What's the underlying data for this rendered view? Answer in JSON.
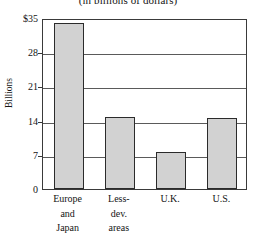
{
  "chart_data": {
    "type": "bar",
    "title": "(in billions of dollars)",
    "xlabel": "",
    "ylabel": "Billions",
    "categories": [
      "Europe and Japan",
      "Less-dev. areas",
      "U.K.",
      "U.S."
    ],
    "category_lines": [
      [
        "Europe",
        "and",
        "Japan"
      ],
      [
        "Less-",
        "dev.",
        "areas"
      ],
      [
        "U.K."
      ],
      [
        "U.S."
      ]
    ],
    "values": [
      34,
      14.7,
      7.5,
      14.5
    ],
    "ylim": [
      0,
      35
    ],
    "yticks": [
      0,
      7,
      14,
      21,
      28,
      35
    ],
    "ytick_labels": [
      "0",
      "7",
      "14",
      "21",
      "28",
      "$35"
    ],
    "grid": true,
    "legend": "none",
    "bar_fill_color": "#d2d2d2",
    "bar_border_color": "#2b2b2b",
    "axis_color": "#3a3a3a",
    "grid_color": "#5a5a5a"
  }
}
